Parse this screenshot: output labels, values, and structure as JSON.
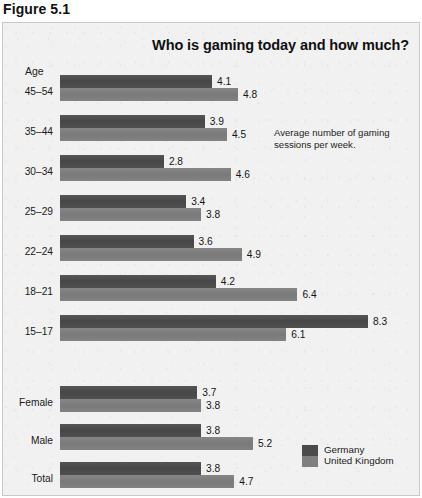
{
  "figure": {
    "caption": "Figure 5.1"
  },
  "chart": {
    "title": "Who is gaming today and how much?",
    "axis_group_label": "Age",
    "annotation": "Average number of gaming sessions per week.",
    "legend": {
      "items": [
        {
          "label": "Germany",
          "color": "#4b4b4b"
        },
        {
          "label": "United Kingdom",
          "color": "#7f7f7f"
        }
      ]
    }
  },
  "chart_data": {
    "type": "bar",
    "orientation": "horizontal",
    "title": "Who is gaming today and how much?",
    "subtitle": "",
    "xlabel": "",
    "ylabel": "Age",
    "annotation": "Average number of gaming sessions per week.",
    "grid": false,
    "legend_position": "bottom-right",
    "xlim": [
      0,
      8.3
    ],
    "value_precision": 1,
    "categories": [
      "45–54",
      "35–44",
      "30–34",
      "25–29",
      "22–24",
      "18–21",
      "15–17",
      "Female",
      "Male",
      "Total"
    ],
    "category_groups": [
      {
        "name": "Age",
        "categories": [
          "45–54",
          "35–44",
          "30–34",
          "25–29",
          "22–24",
          "18–21",
          "15–17"
        ]
      },
      {
        "name": "",
        "categories": [
          "Female",
          "Male",
          "Total"
        ]
      }
    ],
    "series": [
      {
        "name": "Germany",
        "color": "#4b4b4b",
        "values": [
          4.1,
          3.9,
          2.8,
          3.4,
          3.6,
          4.2,
          8.3,
          3.7,
          3.8,
          3.8
        ]
      },
      {
        "name": "United Kingdom",
        "color": "#7f7f7f",
        "values": [
          4.8,
          4.5,
          4.6,
          3.8,
          4.9,
          6.4,
          6.1,
          3.8,
          5.2,
          4.7
        ]
      }
    ],
    "rows": [
      {
        "label": "45–54",
        "germany": 4.1,
        "uk": 4.8
      },
      {
        "label": "35–44",
        "germany": 3.9,
        "uk": 4.5
      },
      {
        "label": "30–34",
        "germany": 2.8,
        "uk": 4.6
      },
      {
        "label": "25–29",
        "germany": 3.4,
        "uk": 3.8
      },
      {
        "label": "22–24",
        "germany": 3.6,
        "uk": 4.9
      },
      {
        "label": "18–21",
        "germany": 4.2,
        "uk": 6.4
      },
      {
        "label": "15–17",
        "germany": 8.3,
        "uk": 6.1
      },
      {
        "label": "Female",
        "germany": 3.7,
        "uk": 3.8
      },
      {
        "label": "Male",
        "germany": 3.8,
        "uk": 5.2
      },
      {
        "label": "Total",
        "germany": 3.8,
        "uk": 4.7
      }
    ]
  },
  "layout": {
    "bar_origin_x": 57,
    "px_per_unit": 37.1,
    "bar_height": 13,
    "row_tops": [
      52,
      92,
      132,
      172,
      212,
      252,
      292,
      363,
      401,
      439
    ],
    "label_baseline_offset": 8
  }
}
